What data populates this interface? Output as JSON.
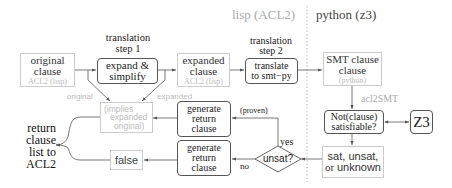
{
  "headers": {
    "lisp": "lisp (ACL2)",
    "python": "python (z3)"
  },
  "nodes": {
    "original": {
      "line1": "original",
      "line2": "clause",
      "sub": "ACL2 (lisp)"
    },
    "step1_caption": {
      "line1": "translation",
      "line2": "step 1"
    },
    "expand": {
      "line1": "expand &",
      "line2": "simplify"
    },
    "expanded": {
      "line1": "expanded",
      "line2": "clause",
      "sub": "ACL2 (lisp)"
    },
    "step2_caption": {
      "line1": "translation",
      "line2": "step 2"
    },
    "translate": {
      "line1": "translate",
      "line2": "to smt−py"
    },
    "smt": {
      "line1": "SMT clause",
      "line2": "clause",
      "sub": "(python)"
    },
    "acl2smt": "acl2SMT",
    "notclause": {
      "line1": "Not(clause)",
      "line2": "satisfiable?"
    },
    "z3": "Z3",
    "result": {
      "line1": "sat, unsat,",
      "line2_a": "or ",
      "line2_b": "unknown"
    },
    "unsat": "unsat?",
    "yes": "yes",
    "no": "no",
    "proven": "(proven)",
    "gen1": {
      "line1": "generate",
      "line2": "return",
      "line3": "clause"
    },
    "gen2": {
      "line1": "generate",
      "line2": "return",
      "line3": "clause"
    },
    "implies": {
      "line1": "(implies",
      "line2": "expanded",
      "line3": "original)"
    },
    "false": "false",
    "original_label": "original",
    "expanded_label": "expanded",
    "return": {
      "line1": "return",
      "line2": "clause",
      "line3": "list to",
      "line4": "ACL2"
    }
  },
  "colors": {
    "solid": "#555555",
    "faint": "#cccccc",
    "faint_text": "#bbbbbb",
    "text": "#222222"
  }
}
